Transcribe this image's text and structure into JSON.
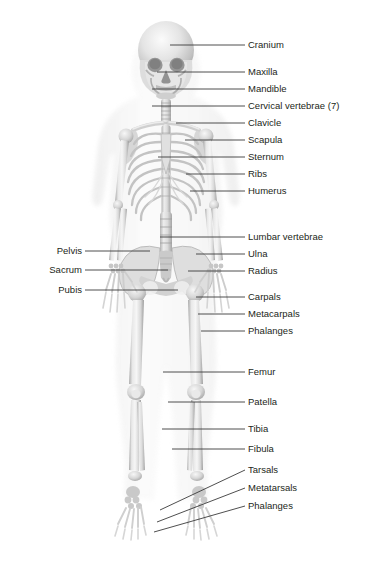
{
  "figure": {
    "background_color": "#ffffff",
    "text_color": "#231f20",
    "leader_line_color": "#3a3a3a",
    "bone_color": "#c9c9c9",
    "bone_highlight": "#efefef",
    "bone_shadow": "#9a9a9a"
  },
  "labels": {
    "right": [
      {
        "text": "Cranium",
        "text_x": 248,
        "text_y": 39,
        "line": [
          [
            170,
            45
          ],
          [
            245,
            45
          ]
        ]
      },
      {
        "text": "Maxilla",
        "text_x": 248,
        "text_y": 66,
        "line": [
          [
            157,
            72
          ],
          [
            245,
            72
          ]
        ]
      },
      {
        "text": "Mandible",
        "text_x": 248,
        "text_y": 83,
        "line": [
          [
            152,
            89
          ],
          [
            245,
            89
          ]
        ]
      },
      {
        "text": "Cervical vertebrae (7)",
        "text_x": 248,
        "text_y": 100,
        "line": [
          [
            152,
            106
          ],
          [
            245,
            106
          ]
        ]
      },
      {
        "text": "Clavicle",
        "text_x": 248,
        "text_y": 117,
        "line": [
          [
            176,
            123
          ],
          [
            245,
            123
          ]
        ]
      },
      {
        "text": "Scapula",
        "text_x": 248,
        "text_y": 134,
        "line": [
          [
            185,
            140
          ],
          [
            245,
            140
          ]
        ]
      },
      {
        "text": "Sternum",
        "text_x": 248,
        "text_y": 151,
        "line": [
          [
            158,
            157
          ],
          [
            245,
            157
          ]
        ]
      },
      {
        "text": "Ribs",
        "text_x": 248,
        "text_y": 168,
        "line": [
          [
            186,
            174
          ],
          [
            245,
            174
          ]
        ]
      },
      {
        "text": "Humerus",
        "text_x": 248,
        "text_y": 185,
        "line": [
          [
            190,
            191
          ],
          [
            245,
            191
          ]
        ]
      },
      {
        "text": "Lumbar vertebrae",
        "text_x": 248,
        "text_y": 231,
        "line": [
          [
            160,
            237
          ],
          [
            245,
            237
          ]
        ]
      },
      {
        "text": "Ulna",
        "text_x": 248,
        "text_y": 248,
        "line": [
          [
            196,
            254
          ],
          [
            245,
            254
          ]
        ]
      },
      {
        "text": "Radius",
        "text_x": 248,
        "text_y": 265,
        "line": [
          [
            188,
            271
          ],
          [
            245,
            271
          ]
        ]
      },
      {
        "text": "Carpals",
        "text_x": 248,
        "text_y": 291,
        "line": [
          [
            196,
            297
          ],
          [
            245,
            297
          ]
        ]
      },
      {
        "text": "Metacarpals",
        "text_x": 248,
        "text_y": 308,
        "line": [
          [
            198,
            314
          ],
          [
            245,
            314
          ]
        ]
      },
      {
        "text": "Phalanges",
        "text_x": 248,
        "text_y": 325,
        "line": [
          [
            201,
            331
          ],
          [
            245,
            331
          ]
        ]
      },
      {
        "text": "Femur",
        "text_x": 248,
        "text_y": 366,
        "line": [
          [
            163,
            372
          ],
          [
            245,
            372
          ]
        ]
      },
      {
        "text": "Patella",
        "text_x": 248,
        "text_y": 396,
        "line": [
          [
            168,
            402
          ],
          [
            245,
            402
          ]
        ]
      },
      {
        "text": "Tibia",
        "text_x": 248,
        "text_y": 423,
        "line": [
          [
            162,
            429
          ],
          [
            245,
            429
          ]
        ]
      },
      {
        "text": "Fibula",
        "text_x": 248,
        "text_y": 443,
        "line": [
          [
            172,
            449
          ],
          [
            245,
            449
          ]
        ]
      },
      {
        "text": "Tarsals",
        "text_x": 248,
        "text_y": 464,
        "line": [
          [
            160,
            510
          ],
          [
            245,
            470
          ]
        ]
      },
      {
        "text": "Metatarsals",
        "text_x": 248,
        "text_y": 482,
        "line": [
          [
            157,
            522
          ],
          [
            245,
            488
          ]
        ]
      },
      {
        "text": "Phalanges",
        "text_x": 248,
        "text_y": 500,
        "line": [
          [
            154,
            532
          ],
          [
            245,
            506
          ]
        ]
      }
    ],
    "left": [
      {
        "text": "Pelvis",
        "text_x": 82,
        "text_y": 245,
        "line": [
          [
            85,
            251
          ],
          [
            150,
            251
          ]
        ]
      },
      {
        "text": "Sacrum",
        "text_x": 82,
        "text_y": 264,
        "line": [
          [
            85,
            270
          ],
          [
            168,
            270
          ]
        ]
      },
      {
        "text": "Pubis",
        "text_x": 82,
        "text_y": 284,
        "line": [
          [
            85,
            290
          ],
          [
            178,
            290
          ]
        ]
      }
    ]
  }
}
